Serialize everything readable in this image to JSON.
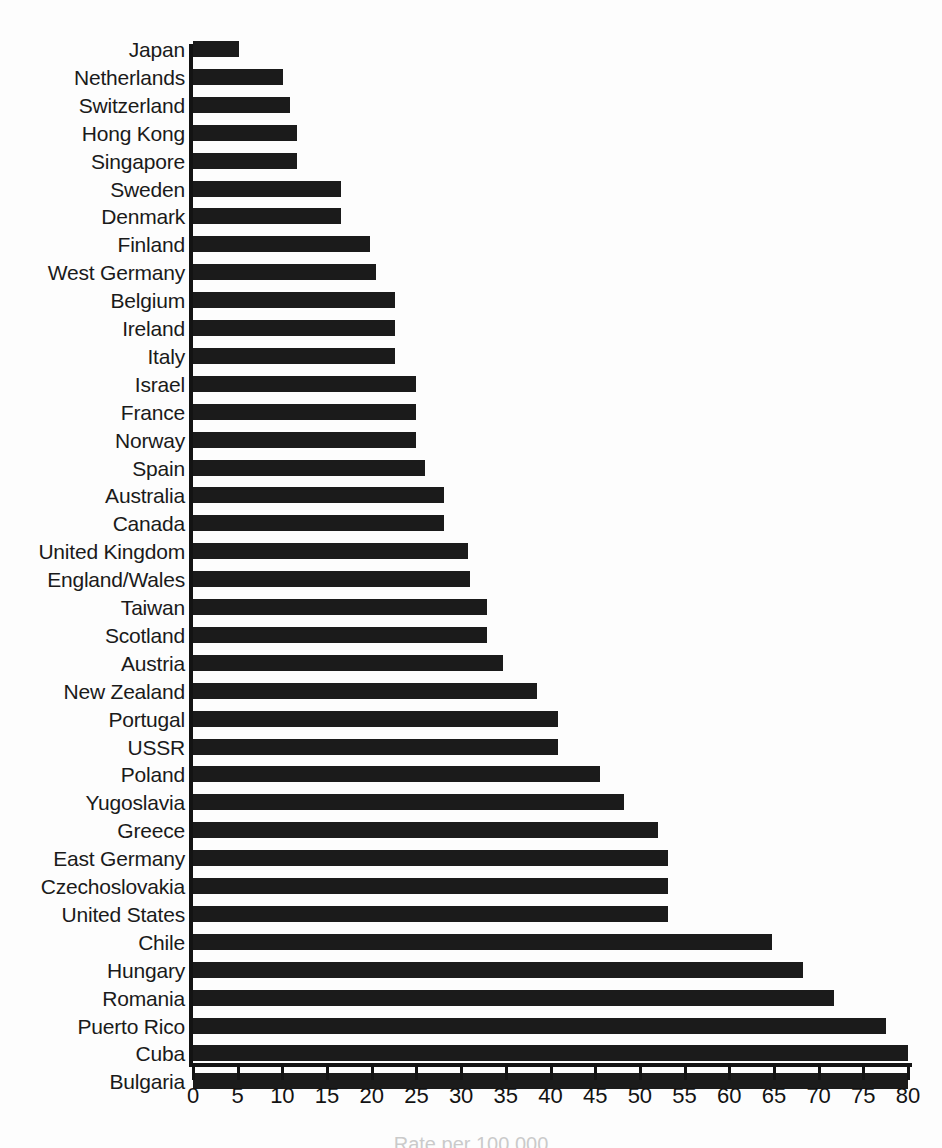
{
  "chart_data": {
    "type": "bar",
    "orientation": "horizontal",
    "title": "",
    "xlabel": "Rate per 100,000",
    "ylabel": "",
    "xlim": [
      0,
      80
    ],
    "xticks": [
      0,
      5,
      10,
      15,
      20,
      25,
      30,
      35,
      40,
      45,
      50,
      55,
      60,
      65,
      70,
      75,
      80
    ],
    "grid": false,
    "legend": null,
    "bar_color": "#1b1b1b",
    "background_color": "#fdfdfd",
    "categories": [
      "Japan",
      "Netherlands",
      "Switzerland",
      "Hong Kong",
      "Singapore",
      "Sweden",
      "Denmark",
      "Finland",
      "West Germany",
      "Belgium",
      "Ireland",
      "Italy",
      "Israel",
      "France",
      "Norway",
      "Spain",
      "Australia",
      "Canada",
      "United Kingdom",
      "England/Wales",
      "Taiwan",
      "Scotland",
      "Austria",
      "New Zealand",
      "Portugal",
      "USSR",
      "Poland",
      "Yugoslavia",
      "Greece",
      "East Germany",
      "Czechoslovakia",
      "United States",
      "Chile",
      "Hungary",
      "Romania",
      "Puerto Rico",
      "Cuba",
      "Bulgaria"
    ],
    "values": [
      5.2,
      10.1,
      10.8,
      11.6,
      11.6,
      16.6,
      16.6,
      19.8,
      20.5,
      22.6,
      22.6,
      22.6,
      24.9,
      24.9,
      24.9,
      26.0,
      28.1,
      28.1,
      30.8,
      31.0,
      32.9,
      32.9,
      34.7,
      38.5,
      40.8,
      40.8,
      45.5,
      48.2,
      52.0,
      53.2,
      53.2,
      53.2,
      64.8,
      68.2,
      71.7,
      77.5,
      80.0,
      80.0
    ]
  }
}
